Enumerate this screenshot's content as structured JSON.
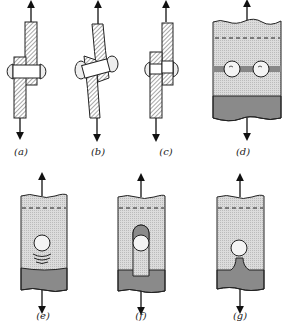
{
  "figure": {
    "panels": [
      {
        "id": "a",
        "label": "(a)"
      },
      {
        "id": "b",
        "label": "(b)"
      },
      {
        "id": "c",
        "label": "(c)"
      },
      {
        "id": "d",
        "label": "(d)"
      },
      {
        "id": "e",
        "label": "(e)"
      },
      {
        "id": "f",
        "label": "(f)"
      },
      {
        "id": "g",
        "label": "(g)"
      }
    ]
  },
  "colors": {
    "ink": "#1a1a1a",
    "light_fill": "#d8d8d8",
    "dark_fill": "#8a8a8a"
  }
}
